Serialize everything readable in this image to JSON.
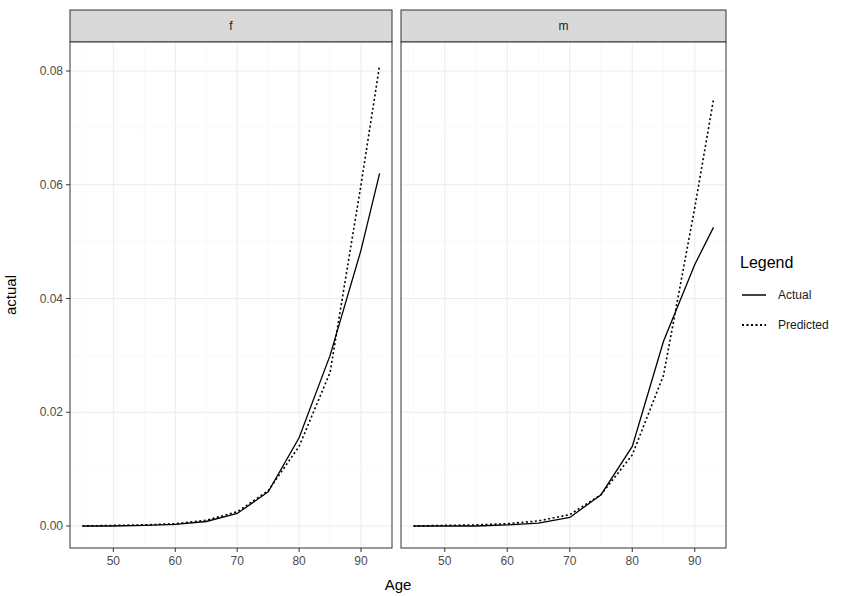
{
  "chart_data": {
    "type": "line",
    "title": "",
    "xlabel": "Age",
    "ylabel": "actual",
    "xlim": [
      43,
      95
    ],
    "ylim": [
      -0.004,
      0.085
    ],
    "x_ticks": [
      50,
      60,
      70,
      80,
      90
    ],
    "y_ticks": [
      0.0,
      0.02,
      0.04,
      0.06,
      0.08
    ],
    "y_tick_labels": [
      "0.00",
      "0.02",
      "0.04",
      "0.06",
      "0.08"
    ],
    "grid": true,
    "legend": {
      "title": "Legend",
      "position": "right",
      "entries": [
        {
          "label": "Actual",
          "linetype": "solid"
        },
        {
          "label": "Predicted",
          "linetype": "dotted"
        }
      ]
    },
    "facets": [
      {
        "strip": "f",
        "x": [
          45,
          50,
          55,
          60,
          65,
          70,
          75,
          80,
          85,
          90,
          93
        ],
        "series": [
          {
            "name": "Actual",
            "values": [
              0.0,
              0.0,
              0.0001,
              0.0003,
              0.0008,
              0.0022,
              0.006,
              0.0155,
              0.03,
              0.0485,
              0.062
            ]
          },
          {
            "name": "Predicted",
            "values": [
              0.0,
              0.0001,
              0.0002,
              0.0004,
              0.001,
              0.0025,
              0.0062,
              0.014,
              0.027,
              0.06,
              0.081
            ]
          }
        ]
      },
      {
        "strip": "m",
        "x": [
          45,
          50,
          55,
          60,
          65,
          70,
          75,
          80,
          85,
          90,
          93
        ],
        "series": [
          {
            "name": "Actual",
            "values": [
              0.0,
              0.0,
              0.0,
              0.0002,
              0.0005,
              0.0015,
              0.0055,
              0.014,
              0.0325,
              0.046,
              0.0525
            ]
          },
          {
            "name": "Predicted",
            "values": [
              0.0,
              0.0001,
              0.0002,
              0.0004,
              0.0009,
              0.002,
              0.0055,
              0.0125,
              0.0265,
              0.056,
              0.075
            ]
          }
        ]
      }
    ]
  }
}
